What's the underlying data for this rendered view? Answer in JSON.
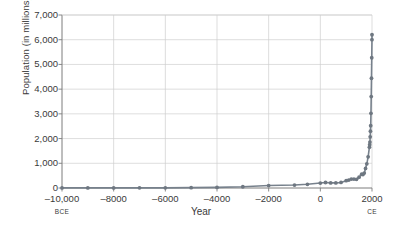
{
  "chart_data": {
    "type": "line",
    "title": "",
    "xlabel": "Year",
    "ylabel": "Population (in millions)",
    "xlim": [
      -10000,
      2000
    ],
    "ylim": [
      0,
      7000
    ],
    "grid": true,
    "legend": false,
    "x_era_left": "BCE",
    "x_era_right": "CE",
    "y_ticks": [
      0,
      1000,
      2000,
      3000,
      4000,
      5000,
      6000,
      7000
    ],
    "y_ticklabels": [
      "0",
      "1,000",
      "2,000",
      "3,000",
      "4,000",
      "5,000",
      "6,000",
      "7,000"
    ],
    "x_ticks": [
      -10000,
      -8000,
      -6000,
      -4000,
      -2000,
      0,
      2000
    ],
    "x_ticklabels": [
      "–10,000",
      "–8000",
      "–6000",
      "–4000",
      "–2000",
      "0",
      "2000"
    ],
    "series_name": "World population",
    "x": [
      -10000,
      -9000,
      -8000,
      -7000,
      -6000,
      -5000,
      -4000,
      -3000,
      -2000,
      -1000,
      -500,
      0,
      200,
      400,
      600,
      800,
      1000,
      1100,
      1200,
      1300,
      1400,
      1500,
      1600,
      1650,
      1700,
      1750,
      1800,
      1850,
      1900,
      1910,
      1920,
      1930,
      1940,
      1950,
      1960,
      1970,
      1980,
      1990,
      1999,
      2000
    ],
    "values": [
      4,
      5,
      5,
      7,
      7,
      15,
      25,
      50,
      100,
      120,
      150,
      200,
      223,
      206,
      206,
      224,
      295,
      320,
      360,
      360,
      350,
      438,
      556,
      545,
      603,
      791,
      978,
      1262,
      1650,
      1750,
      1860,
      2070,
      2300,
      2520,
      3020,
      3700,
      4440,
      5270,
      6000,
      6200
    ],
    "colors": {
      "series": "#6e7781",
      "grid": "#cfcfcf",
      "axis": "#7d7d7d",
      "text": "#3a3a3a",
      "background": "#ffffff"
    }
  },
  "figure": {
    "width": 402,
    "height": 228,
    "plot_left": 62,
    "plot_right": 372,
    "plot_top": 15,
    "plot_bottom": 188
  }
}
